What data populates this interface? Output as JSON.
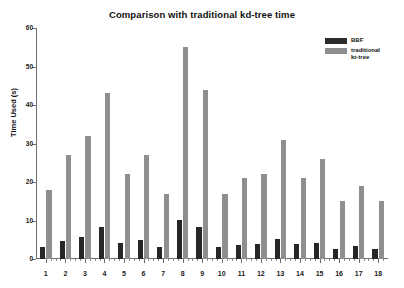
{
  "chart_data": {
    "type": "bar",
    "title": "Comparison with traditional kd-tree time",
    "xlabel": "",
    "ylabel": "Time Used (s)",
    "ylim": [
      0,
      60
    ],
    "yticks": [
      0,
      10,
      20,
      30,
      40,
      50,
      60
    ],
    "grid": false,
    "legend_position": "upper right",
    "categories": [
      "1",
      "2",
      "3",
      "4",
      "5",
      "6",
      "7",
      "8",
      "9",
      "10",
      "11",
      "12",
      "13",
      "14",
      "15",
      "16",
      "17",
      "18"
    ],
    "series": [
      {
        "name": "BBF",
        "color": "#262626",
        "values": [
          3.2,
          4.7,
          5.6,
          8.3,
          4.2,
          5.0,
          3.0,
          10.1,
          8.4,
          3.1,
          3.7,
          3.9,
          5.3,
          3.8,
          4.2,
          2.6,
          3.4,
          2.7
        ]
      },
      {
        "name": "traditional\nkt-tree",
        "color": "#8f8f8f",
        "values": [
          18,
          27,
          32,
          43,
          22,
          27,
          17,
          55,
          44,
          17,
          21,
          22,
          31,
          21,
          26,
          15,
          19,
          15
        ]
      }
    ]
  },
  "legend": {
    "entries": [
      {
        "label": "BBF",
        "swatch": "bbf"
      },
      {
        "label": "traditional\nkt-tree",
        "swatch": "kd"
      }
    ]
  }
}
